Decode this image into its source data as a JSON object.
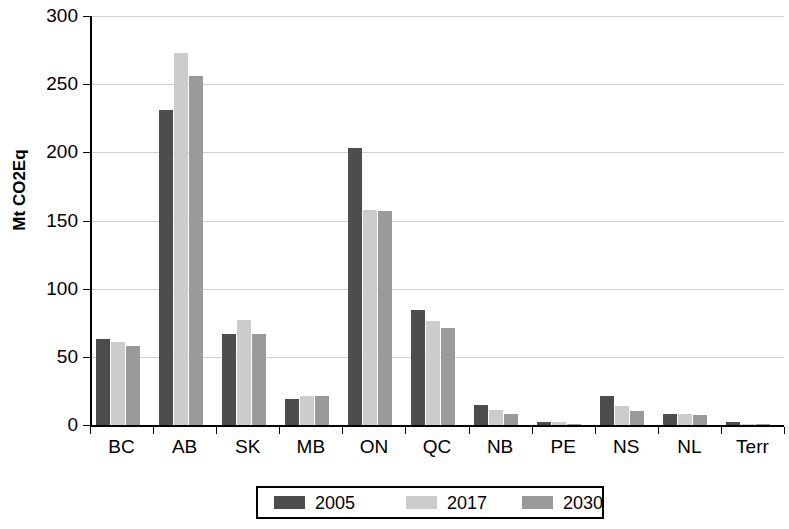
{
  "chart_data": {
    "type": "bar",
    "title": "",
    "subtitle": "",
    "xlabel": "",
    "ylabel": "Mt CO2Eq",
    "ylim": [
      0,
      300
    ],
    "ytick_step": 50,
    "yticks": [
      300,
      250,
      200,
      150,
      100,
      50,
      0
    ],
    "grid": true,
    "legend_position": "bottom",
    "categories": [
      "BC",
      "AB",
      "SK",
      "MB",
      "ON",
      "QC",
      "NB",
      "PE",
      "NS",
      "NL",
      "Terr"
    ],
    "series": [
      {
        "name": "2005",
        "color": "#4d4d4d",
        "values": [
          63,
          231,
          67,
          19,
          203,
          84,
          15,
          2,
          21,
          8,
          2
        ]
      },
      {
        "name": "2017",
        "color": "#cccccc",
        "values": [
          61,
          273,
          77,
          21,
          158,
          76,
          11,
          2,
          14,
          8,
          1
        ]
      },
      {
        "name": "2030",
        "color": "#9a9a9a",
        "values": [
          58,
          256,
          67,
          21,
          157,
          71,
          8,
          1,
          10,
          7,
          1
        ]
      }
    ]
  }
}
